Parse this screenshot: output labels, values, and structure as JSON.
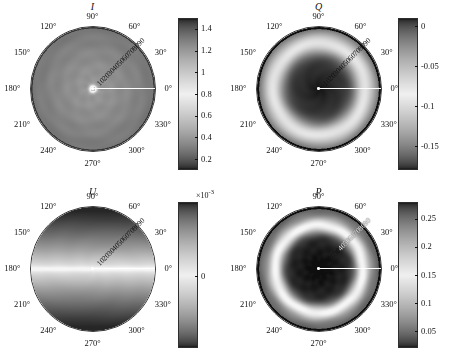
{
  "figure": {
    "panel_count": 4,
    "angular_ticks": [
      "0°",
      "30°",
      "60°",
      "90°",
      "120°",
      "150°",
      "180°",
      "210°",
      "240°",
      "270°",
      "300°",
      "330°"
    ],
    "radial_ticks": [
      "10",
      "20",
      "30",
      "40",
      "50",
      "60",
      "70",
      "80",
      "90"
    ],
    "caption_fragment": ""
  },
  "chart_data": [
    {
      "type": "heatmap",
      "title": "I",
      "projection": "polar",
      "angular_unit": "degrees",
      "angular_ticks": [
        0,
        30,
        60,
        90,
        120,
        150,
        180,
        210,
        240,
        270,
        300,
        330
      ],
      "angular_tick_labels": [
        "0°",
        "30°",
        "60°",
        "90°",
        "120°",
        "150°",
        "180°",
        "210°",
        "240°",
        "270°",
        "300°",
        "330°"
      ],
      "radial_ticks": [
        10,
        20,
        30,
        40,
        50,
        60,
        70,
        80,
        90
      ],
      "radial_tick_labels": [
        "10",
        "20",
        "30",
        "40",
        "50",
        "60",
        "70",
        "80",
        "90"
      ],
      "radial_label_angle_deg": 45,
      "rlim": [
        0,
        90
      ],
      "colorbar": {
        "ticks": [
          1.4,
          1.2,
          1,
          0.8,
          0.6,
          0.4,
          0.2
        ],
        "tick_labels": [
          "1.4",
          "1.2",
          "1",
          "0.8",
          "0.6",
          "0.4",
          "0.2"
        ],
        "multiplier": "",
        "vmin": 0.1,
        "vmax": 1.5,
        "orientation": "vertical",
        "colormap": "gray-reversed-center-bright"
      },
      "pattern": "near-uniform mid-gray disk, bright narrow hot spot at center, slight darkening toward rim",
      "radial_profile": {
        "r": [
          0,
          5,
          10,
          20,
          30,
          40,
          50,
          60,
          70,
          80,
          90
        ],
        "value": [
          0.15,
          1.45,
          0.95,
          0.9,
          0.88,
          0.87,
          0.86,
          0.85,
          0.84,
          0.82,
          0.78
        ]
      },
      "grid": true,
      "legend": "none"
    },
    {
      "type": "heatmap",
      "title": "Q",
      "projection": "polar",
      "angular_unit": "degrees",
      "angular_ticks": [
        0,
        30,
        60,
        90,
        120,
        150,
        180,
        210,
        240,
        270,
        300,
        330
      ],
      "angular_tick_labels": [
        "0°",
        "30°",
        "60°",
        "90°",
        "120°",
        "150°",
        "180°",
        "210°",
        "240°",
        "270°",
        "300°",
        "330°"
      ],
      "radial_ticks": [
        10,
        20,
        30,
        40,
        50,
        60,
        70,
        80,
        90
      ],
      "radial_tick_labels": [
        "10",
        "20",
        "30",
        "40",
        "50",
        "60",
        "70",
        "80",
        "90"
      ],
      "radial_label_angle_deg": 45,
      "rlim": [
        0,
        90
      ],
      "colorbar": {
        "ticks": [
          0,
          -0.05,
          -0.1,
          -0.15
        ],
        "tick_labels": [
          "0",
          "-0.05",
          "-0.1",
          "-0.15"
        ],
        "multiplier": "",
        "vmin": -0.18,
        "vmax": 0.01,
        "orientation": "vertical",
        "colormap": "gray-reversed"
      },
      "pattern": "dark core region near center, brightening to a light ring near r=60-70, thin dark rim",
      "radial_profile": {
        "r": [
          0,
          10,
          20,
          30,
          40,
          50,
          60,
          70,
          80,
          90
        ],
        "value": [
          -0.17,
          -0.16,
          -0.15,
          -0.13,
          -0.11,
          -0.08,
          -0.05,
          -0.04,
          -0.06,
          -0.17
        ]
      },
      "grid": true,
      "legend": "none"
    },
    {
      "type": "heatmap",
      "title": "U",
      "projection": "polar",
      "angular_unit": "degrees",
      "angular_ticks": [
        0,
        30,
        60,
        90,
        120,
        150,
        180,
        210,
        240,
        270,
        300,
        330
      ],
      "angular_tick_labels": [
        "0°",
        "30°",
        "60°",
        "90°",
        "120°",
        "150°",
        "180°",
        "210°",
        "240°",
        "270°",
        "300°",
        "330°"
      ],
      "radial_ticks": [
        10,
        20,
        30,
        40,
        50,
        60,
        70,
        80,
        90
      ],
      "radial_tick_labels": [
        "10",
        "20",
        "30",
        "40",
        "50",
        "60",
        "70",
        "80",
        "90"
      ],
      "radial_label_angle_deg": 45,
      "rlim": [
        0,
        90
      ],
      "colorbar": {
        "ticks": [
          6,
          4,
          2,
          0,
          -2,
          -4,
          -6
        ],
        "tick_labels": [
          "6",
          "4",
          "2",
          "0",
          "-2",
          "-4",
          "-6"
        ],
        "multiplier": "×10",
        "multiplier_exponent": "-3",
        "vmin": -0.007,
        "vmax": 0.0072,
        "orientation": "vertical",
        "colormap": "gray-reversed"
      },
      "pattern": "horizontal band structure: dark at top (90°) and bottom (270°), bright white band across the 0°-180° horizontal axis",
      "profile_note": "value approximately proportional to -sin(2*theta) type horizontal banding, magnitude ~7e-3 at top/bottom, ~0 along horizontal",
      "grid": true,
      "legend": "none"
    },
    {
      "type": "heatmap",
      "title": "P",
      "projection": "polar",
      "angular_unit": "degrees",
      "angular_ticks": [
        0,
        30,
        60,
        90,
        120,
        150,
        180,
        210,
        240,
        270,
        300,
        330
      ],
      "angular_tick_labels": [
        "0°",
        "30°",
        "60°",
        "90°",
        "120°",
        "150°",
        "180°",
        "210°",
        "240°",
        "270°",
        "300°",
        "330°"
      ],
      "radial_ticks": [
        10,
        20,
        30,
        40,
        50,
        60,
        70,
        80,
        90
      ],
      "radial_tick_labels": [
        "10",
        "20",
        "30",
        "40",
        "50",
        "60",
        "70",
        "80",
        "90"
      ],
      "radial_label_angle_deg": 45,
      "rlim": [
        0,
        90
      ],
      "colorbar": {
        "ticks": [
          0.25,
          0.2,
          0.15,
          0.1,
          0.05
        ],
        "tick_labels": [
          "0.25",
          "0.2",
          "0.15",
          "0.1",
          "0.05"
        ],
        "multiplier": "",
        "vmin": 0.02,
        "vmax": 0.28,
        "orientation": "vertical",
        "colormap": "gray-reversed"
      },
      "pattern": "dark core near center, bright annulus at r≈55-65, mid-gray outer region, dark rim",
      "radial_profile": {
        "r": [
          0,
          10,
          20,
          30,
          40,
          50,
          60,
          70,
          80,
          90
        ],
        "value": [
          0.27,
          0.26,
          0.24,
          0.21,
          0.17,
          0.12,
          0.06,
          0.05,
          0.1,
          0.26
        ]
      },
      "grid": true,
      "legend": "none"
    }
  ]
}
